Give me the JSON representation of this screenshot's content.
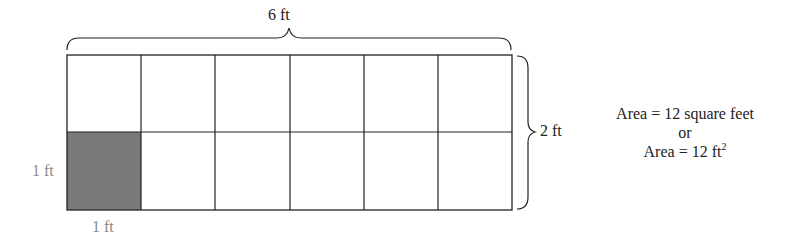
{
  "diagram": {
    "grid": {
      "columns": 6,
      "rows": 2,
      "shaded_cell": {
        "row": 2,
        "column": 1
      }
    },
    "labels": {
      "width": "6 ft",
      "height": "2 ft",
      "unit_side_vertical": "1 ft",
      "unit_side_horizontal": "1 ft"
    },
    "equations": {
      "line1": "Area = 12 square feet",
      "line2": "or",
      "line3_prefix": "Area = 12 ft",
      "line3_exponent": "2"
    },
    "colors": {
      "grid_line": "#222222",
      "shaded_cell": "#7a7a7a",
      "unit_label": "#8a8a8a",
      "text": "#222222"
    }
  }
}
